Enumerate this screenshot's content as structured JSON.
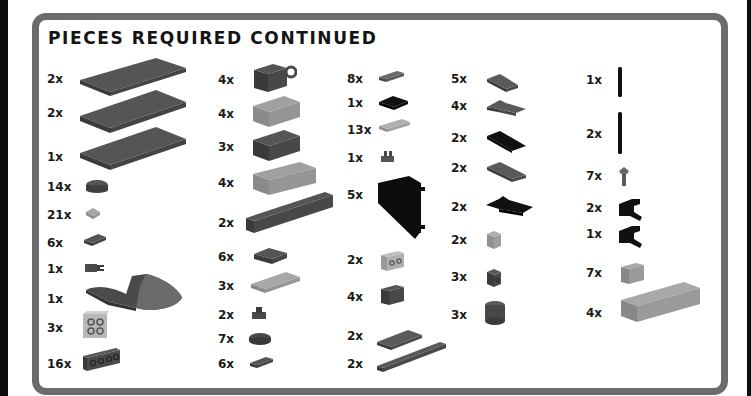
{
  "page": {
    "title": "PIECES REQUIRED CONTINUED"
  },
  "colors": {
    "frame": "#6b6b6b",
    "dark_gray": "#4a4a4c",
    "light_gray": "#9a9a9a",
    "black": "#111111"
  },
  "columns": [
    {
      "items": [
        {
          "qty": "2x",
          "piece": "plate-6x10-dark-gray"
        },
        {
          "qty": "2x",
          "piece": "plate-6x10-dark-gray"
        },
        {
          "qty": "1x",
          "piece": "plate-6x10-dark-gray"
        },
        {
          "qty": "14x",
          "piece": "plate-2x2-round-dark-gray"
        },
        {
          "qty": "21x",
          "piece": "plate-1x1-light-gray"
        },
        {
          "qty": "6x",
          "piece": "plate-1x2-dark-gray"
        },
        {
          "qty": "1x",
          "piece": "plate-clip-dark-gray"
        },
        {
          "qty": "1x",
          "piece": "wedge-hull-dark-gray"
        },
        {
          "qty": "3x",
          "piece": "brick-studs-side-light-gray"
        },
        {
          "qty": "16x",
          "piece": "brick-1x4-studs-side-dark-gray"
        }
      ]
    },
    {
      "items": [
        {
          "qty": "4x",
          "piece": "brick-2x2-pin-hole-dark-gray"
        },
        {
          "qty": "4x",
          "piece": "brick-2x4-light-gray"
        },
        {
          "qty": "3x",
          "piece": "brick-2x4-dark-gray"
        },
        {
          "qty": "4x",
          "piece": "brick-2x6-light-gray"
        },
        {
          "qty": "2x",
          "piece": "brick-1x10-dark-gray"
        },
        {
          "qty": "6x",
          "piece": "plate-2x2-dark-gray"
        },
        {
          "qty": "3x",
          "piece": "tile-2x4-light-gray"
        },
        {
          "qty": "2x",
          "piece": "plate-1x1-clip-dark-gray"
        },
        {
          "qty": "7x",
          "piece": "tile-round-2x2-dark-gray"
        },
        {
          "qty": "6x",
          "piece": "tile-1x2-dark-gray"
        }
      ]
    },
    {
      "items": [
        {
          "qty": "8x",
          "piece": "tile-1x2-dark-gray"
        },
        {
          "qty": "1x",
          "piece": "plate-2x2-black"
        },
        {
          "qty": "13x",
          "piece": "tile-1x3-light-gray"
        },
        {
          "qty": "1x",
          "piece": "plate-clip-dark-gray"
        },
        {
          "qty": "5x",
          "piece": "panel-wedge-black"
        },
        {
          "qty": "2x",
          "piece": "brick-1x2-studs-side-light-gray"
        },
        {
          "qty": "4x",
          "piece": "brick-1x2-dark-gray"
        },
        {
          "qty": "2x",
          "piece": "tile-2x4-dark-gray"
        },
        {
          "qty": "2x",
          "piece": "tile-1x8-dark-gray"
        }
      ]
    },
    {
      "items": [
        {
          "qty": "5x",
          "piece": "wedge-plate-dark-gray"
        },
        {
          "qty": "4x",
          "piece": "wedge-plate-notched-dark-gray"
        },
        {
          "qty": "2x",
          "piece": "wedge-plate-black"
        },
        {
          "qty": "2x",
          "piece": "wedge-plate-dark-gray"
        },
        {
          "qty": "2x",
          "piece": "wedge-plate-notched-black"
        },
        {
          "qty": "2x",
          "piece": "brick-1x1-light-gray"
        },
        {
          "qty": "3x",
          "piece": "brick-1x1-side-stud-dark-gray"
        },
        {
          "qty": "3x",
          "piece": "brick-round-2x2-dark-gray"
        }
      ]
    },
    {
      "items": [
        {
          "qty": "1x",
          "piece": "bar-short-black"
        },
        {
          "qty": "2x",
          "piece": "bar-long-black"
        },
        {
          "qty": "7x",
          "piece": "pin-clip-dark-gray"
        },
        {
          "qty": "2x",
          "piece": "clip-bracket-black"
        },
        {
          "qty": "1x",
          "piece": "clip-bracket-black"
        },
        {
          "qty": "7x",
          "piece": "brick-1x2-light-gray"
        },
        {
          "qty": "4x",
          "piece": "brick-2x6-light-gray"
        }
      ]
    }
  ]
}
